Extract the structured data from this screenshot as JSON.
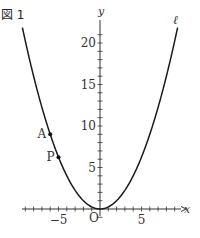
{
  "figure": {
    "title": "図 1",
    "curve_label": "ℓ",
    "axis_x_label": "x",
    "axis_y_label": "y",
    "origin_label": "O",
    "points": [
      {
        "name": "A",
        "x": -6,
        "y": 9
      },
      {
        "name": "P",
        "x": -5,
        "y": 6.25
      }
    ],
    "x_tick_labels": [
      {
        "value": -5,
        "text": "−5"
      },
      {
        "value": 5,
        "text": "5"
      }
    ],
    "y_tick_labels": [
      {
        "value": 5,
        "text": "5"
      },
      {
        "value": 10,
        "text": "10"
      },
      {
        "value": 15,
        "text": "15"
      },
      {
        "value": 20,
        "text": "20"
      }
    ],
    "curve": "y = x^2 / 4",
    "x_range": [
      -9.4,
      9.4
    ],
    "y_range": [
      -1,
      22
    ],
    "colors": {
      "curve": "#1a1a1a",
      "axes": "#333333",
      "text": "#333333"
    }
  }
}
